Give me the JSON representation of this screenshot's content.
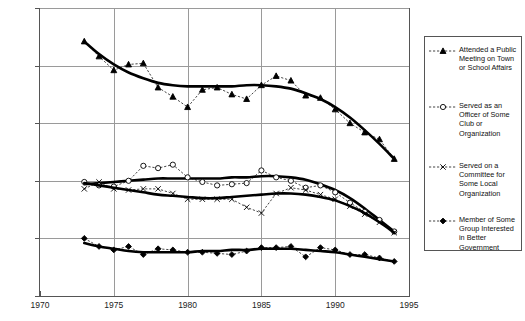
{
  "chart_data": {
    "type": "line",
    "title": "",
    "subtitle": "",
    "xlabel": "",
    "ylabel": "",
    "xlim": [
      1970,
      1995
    ],
    "ylim": [
      0,
      25
    ],
    "xticks": [
      1970,
      1975,
      1980,
      1985,
      1990,
      1995
    ],
    "xticklabels": [
      "1970",
      "1975",
      "1980",
      "1985",
      "1990",
      "1995"
    ],
    "yticks": [
      0,
      5,
      10,
      15,
      20,
      25
    ],
    "yticklabels": [
      "0%",
      "5%",
      "10%",
      "15%",
      "20%",
      "25%"
    ],
    "grid": true,
    "legend_position": "right",
    "value_unit": "percent",
    "series": [
      {
        "name": "Attended a Public Meeting on Town or School Affairs",
        "marker": "filled-triangle",
        "x": [
          1973,
          1974,
          1975,
          1976,
          1977,
          1978,
          1979,
          1980,
          1981,
          1982,
          1983,
          1984,
          1985,
          1986,
          1987,
          1988,
          1989,
          1990,
          1991,
          1992,
          1993,
          1994
        ],
        "values": [
          22.1,
          20.8,
          19.6,
          20.1,
          20.2,
          18.1,
          17.3,
          16.4,
          17.9,
          18.1,
          17.5,
          17.1,
          18.3,
          19.1,
          18.7,
          17.4,
          17.2,
          16.2,
          15.0,
          14.2,
          13.6,
          11.9
        ],
        "trend": [
          22.1,
          21.0,
          20.1,
          19.4,
          18.9,
          18.5,
          18.3,
          18.2,
          18.2,
          18.2,
          18.2,
          18.3,
          18.3,
          18.2,
          18.0,
          17.6,
          17.1,
          16.4,
          15.5,
          14.4,
          13.2,
          11.9
        ]
      },
      {
        "name": "Served as an Officer of Some Club or Organization",
        "marker": "open-circle",
        "x": [
          1973,
          1974,
          1975,
          1976,
          1977,
          1978,
          1979,
          1980,
          1981,
          1982,
          1983,
          1984,
          1985,
          1986,
          1987,
          1988,
          1989,
          1990,
          1991,
          1992,
          1993,
          1994
        ],
        "values": [
          9.9,
          9.6,
          9.5,
          10.0,
          11.3,
          11.1,
          11.4,
          10.3,
          9.9,
          9.6,
          9.7,
          9.8,
          10.9,
          10.3,
          10.0,
          9.4,
          9.6,
          9.0,
          8.1,
          7.3,
          6.6,
          5.6
        ],
        "trend": [
          9.7,
          9.8,
          9.9,
          10.0,
          10.1,
          10.2,
          10.2,
          10.2,
          10.2,
          10.2,
          10.3,
          10.3,
          10.4,
          10.4,
          10.3,
          10.1,
          9.7,
          9.2,
          8.5,
          7.6,
          6.6,
          5.6
        ]
      },
      {
        "name": "Served on a Committee for Some Local Organization",
        "marker": "x-mark",
        "x": [
          1973,
          1974,
          1975,
          1976,
          1977,
          1978,
          1979,
          1980,
          1981,
          1982,
          1983,
          1984,
          1985,
          1986,
          1987,
          1988,
          1989,
          1990,
          1991,
          1992,
          1993,
          1994
        ],
        "values": [
          9.3,
          9.9,
          9.3,
          9.2,
          9.3,
          9.3,
          8.9,
          8.4,
          8.4,
          8.4,
          8.4,
          7.7,
          7.2,
          8.9,
          9.4,
          9.2,
          8.8,
          8.4,
          7.8,
          7.1,
          6.4,
          5.5
        ],
        "trend": [
          9.8,
          9.6,
          9.4,
          9.2,
          9.0,
          8.8,
          8.7,
          8.6,
          8.5,
          8.5,
          8.6,
          8.7,
          8.8,
          8.9,
          8.9,
          8.8,
          8.6,
          8.3,
          7.8,
          7.2,
          6.4,
          5.5
        ]
      },
      {
        "name": "Member of Some Group Interested in Better Government",
        "marker": "filled-diamond",
        "x": [
          1973,
          1974,
          1975,
          1976,
          1977,
          1978,
          1979,
          1980,
          1981,
          1982,
          1983,
          1984,
          1985,
          1986,
          1987,
          1988,
          1989,
          1990,
          1991,
          1992,
          1993,
          1994
        ],
        "values": [
          5.0,
          4.3,
          4.0,
          4.3,
          3.6,
          4.1,
          4.0,
          3.8,
          3.8,
          3.7,
          3.6,
          3.9,
          4.2,
          4.2,
          4.3,
          3.4,
          4.2,
          4.0,
          3.6,
          3.6,
          3.3,
          3.0
        ],
        "trend": [
          4.6,
          4.3,
          4.1,
          3.9,
          3.8,
          3.8,
          3.8,
          3.8,
          3.9,
          3.9,
          4.0,
          4.0,
          4.1,
          4.1,
          4.1,
          4.0,
          3.9,
          3.8,
          3.6,
          3.4,
          3.2,
          3.0
        ]
      }
    ]
  },
  "legend": {
    "entries": [
      {
        "label": "Attended a Public\nMeeting on Town\nor School Affairs",
        "marker": "filled-triangle"
      },
      {
        "label": "Served as an\nOfficer of Some\nClub or\nOrganization",
        "marker": "open-circle"
      },
      {
        "label": "Served on a\nCommittee for\nSome Local\nOrganization",
        "marker": "x-mark"
      },
      {
        "label": "Member of Some\nGroup Interested\nin Better\nGovernment",
        "marker": "filled-diamond"
      }
    ]
  },
  "colors": {
    "line": "#000000",
    "grid": "#9a9a9a",
    "axis": "#555555",
    "background": "#ffffff"
  }
}
